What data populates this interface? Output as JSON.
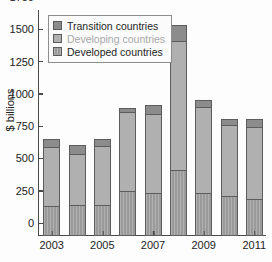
{
  "chart_data": {
    "type": "bar",
    "subtype": "stacked",
    "title": "",
    "xlabel": "",
    "ylabel": "$ billions",
    "ylim": [
      0,
      1750
    ],
    "yticks": [
      0,
      250,
      500,
      750,
      1000,
      1250,
      1500,
      1750
    ],
    "ytick_labels": [
      "0",
      "250",
      "500",
      "750",
      "1000",
      "1250",
      "1500",
      "1750"
    ],
    "grid": false,
    "legend_position": "upper-left",
    "categories": [
      "2003",
      "2004",
      "2005",
      "2006",
      "2007",
      "2008",
      "2009",
      "2010",
      "2011"
    ],
    "xtick_labels": [
      "2003",
      "2005",
      "2007",
      "2009",
      "2011"
    ],
    "xtick_categories": [
      "2003",
      "2005",
      "2007",
      "2009",
      "2011"
    ],
    "series": [
      {
        "name": "Developed countries",
        "color": "#9a9a9a",
        "values": [
          235,
          240,
          240,
          350,
          335,
          510,
          330,
          310,
          290
        ]
      },
      {
        "name": "Developing countries",
        "color": "#b0b0b0",
        "values": [
          465,
          405,
          465,
          615,
          615,
          1005,
          680,
          560,
          565
        ]
      },
      {
        "name": "Transition countries",
        "color": "#8c8c8c",
        "values": [
          70,
          75,
          60,
          40,
          80,
          135,
          55,
          55,
          70
        ]
      }
    ],
    "totals": [
      770,
      720,
      765,
      1005,
      1030,
      1650,
      1065,
      925,
      925
    ],
    "legend": [
      {
        "label": "Transition countries",
        "key": "transition",
        "faint": false
      },
      {
        "label": "Developing countries",
        "key": "developing",
        "faint": true
      },
      {
        "label": "Developed countries",
        "key": "developed",
        "faint": false
      }
    ]
  }
}
